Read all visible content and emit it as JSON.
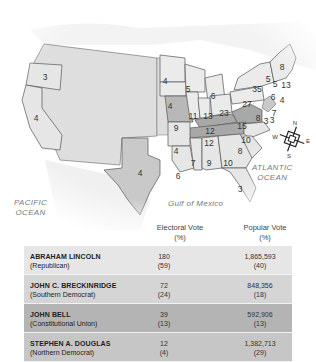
{
  "map": {
    "oceans": {
      "pacific": [
        "PACIFIC",
        "OCEAN"
      ],
      "atlantic": [
        "ATLANTIC",
        "OCEAN"
      ],
      "gulf": "Gulf of Mexico"
    },
    "compass": {
      "n": "N",
      "e": "E",
      "s": "S",
      "w": "W"
    },
    "colors": {
      "lincoln_states": "#ebebeb",
      "breckinridge_states": "#c9c9c9",
      "bell_states": "#a8a8a8",
      "douglas_states": "#b8b8b8",
      "territories": "#dedede"
    },
    "state_electoral_votes": [
      {
        "state": "OR",
        "value": "3"
      },
      {
        "state": "CA",
        "value": "4"
      },
      {
        "state": "TX",
        "value": "4"
      },
      {
        "state": "MN",
        "value": "4"
      },
      {
        "state": "IA",
        "value": "4"
      },
      {
        "state": "WI",
        "value": "5"
      },
      {
        "state": "MI",
        "value": "6"
      },
      {
        "state": "IL",
        "value": "11"
      },
      {
        "state": "IN",
        "value": "13"
      },
      {
        "state": "OH",
        "value": "23"
      },
      {
        "state": "PA",
        "value": "27"
      },
      {
        "state": "NY",
        "value": "35"
      },
      {
        "state": "ME",
        "value": "8"
      },
      {
        "state": "VT",
        "value": "5"
      },
      {
        "state": "NH",
        "value": "5"
      },
      {
        "state": "MA",
        "value": "13"
      },
      {
        "state": "CT",
        "value": "6"
      },
      {
        "state": "RI",
        "value": "4"
      },
      {
        "state": "NJ",
        "value": "7"
      },
      {
        "state": "DE",
        "value": "3"
      },
      {
        "state": "MD",
        "value": "8"
      },
      {
        "state": "MD2",
        "value": "3"
      },
      {
        "state": "MO",
        "value": "9"
      },
      {
        "state": "KY",
        "value": "12"
      },
      {
        "state": "VA",
        "value": "15"
      },
      {
        "state": "TN",
        "value": "12"
      },
      {
        "state": "NC",
        "value": "10"
      },
      {
        "state": "SC",
        "value": "8"
      },
      {
        "state": "AR",
        "value": "4"
      },
      {
        "state": "MS",
        "value": "7"
      },
      {
        "state": "AL",
        "value": "9"
      },
      {
        "state": "GA",
        "value": "10"
      },
      {
        "state": "LA",
        "value": "6"
      },
      {
        "state": "FL",
        "value": "3"
      }
    ]
  },
  "table": {
    "headers": {
      "electoral": [
        "Electoral Vote",
        "(%)"
      ],
      "popular": [
        "Popular Vote",
        "(%)"
      ]
    },
    "rows": [
      {
        "name": "ABRAHAM LINCOLN",
        "party": "(Republican)",
        "electoral": "180",
        "electoral_pct": "(59)",
        "popular": "1,865,593",
        "popular_pct": "(40)",
        "color": "#e6e6e6"
      },
      {
        "name": "JOHN C. BRECKINRIDGE",
        "party": "(Southern Democrat)",
        "electoral": "72",
        "electoral_pct": "(24)",
        "popular": "848,356",
        "popular_pct": "(18)",
        "color": "#d5d5d5"
      },
      {
        "name": "JOHN BELL",
        "party": "(Constitutional Union)",
        "electoral": "39",
        "electoral_pct": "(13)",
        "popular": "592,906",
        "popular_pct": "(13)",
        "color": "#b4b4b4"
      },
      {
        "name": "STEPHEN A. DOUGLAS",
        "party": "(Northern Democrat)",
        "electoral": "12",
        "electoral_pct": "(4)",
        "popular": "1,382,713",
        "popular_pct": "(29)",
        "color": "#c6c6c6"
      }
    ]
  }
}
